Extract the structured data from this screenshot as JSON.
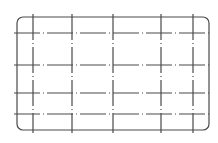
{
  "diagram": {
    "type": "grid",
    "width": 218,
    "height": 143,
    "background": "#ffffff",
    "stroke_color": "#4a4a4a",
    "stroke_width": 1.2,
    "frame": {
      "x": 17,
      "y": 17,
      "width": 192,
      "height": 113,
      "corner_radius": 6
    },
    "vertical_lines": [
      {
        "x": 33,
        "y1": 14,
        "y2": 133
      },
      {
        "x": 72,
        "y1": 14,
        "y2": 133
      },
      {
        "x": 113,
        "y1": 14,
        "y2": 133
      },
      {
        "x": 161,
        "y1": 14,
        "y2": 133
      },
      {
        "x": 193,
        "y1": 14,
        "y2": 133
      }
    ],
    "horizontal_lines": [
      {
        "y": 33,
        "x1": 14,
        "x2": 212
      },
      {
        "y": 65,
        "x1": 14,
        "x2": 212
      },
      {
        "y": 93,
        "x1": 14,
        "x2": 212
      },
      {
        "y": 114,
        "x1": 14,
        "x2": 212
      }
    ],
    "line_pattern": "dash-dot",
    "dash_array": "26 3 1 3"
  }
}
